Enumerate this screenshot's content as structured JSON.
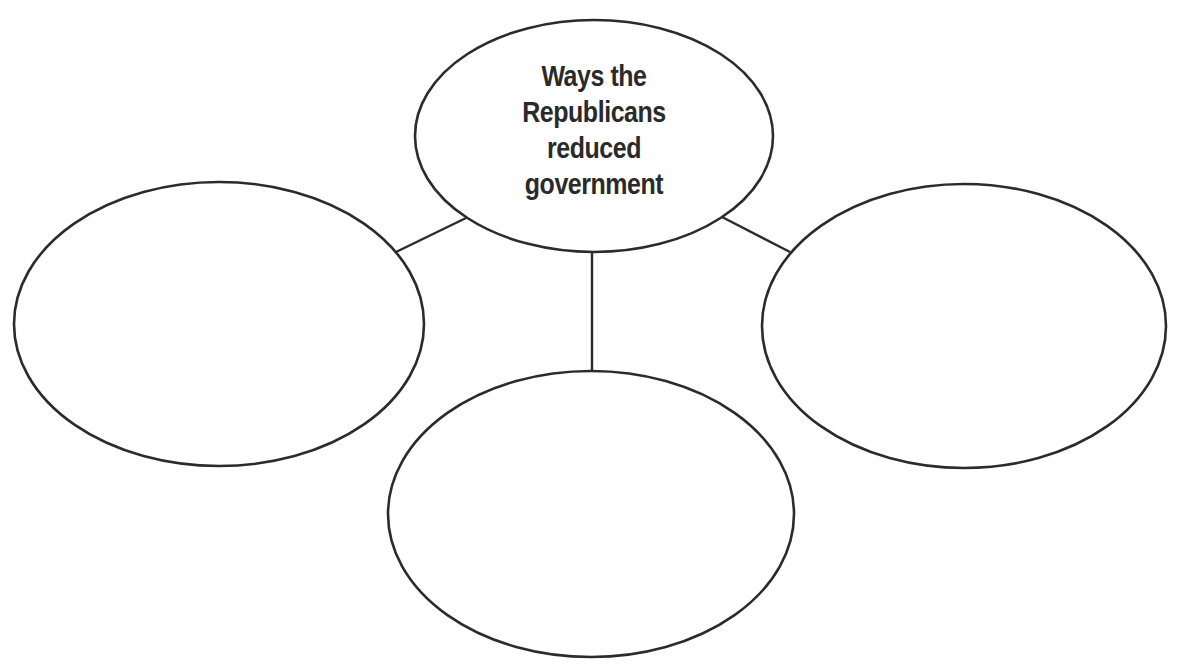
{
  "diagram": {
    "type": "concept-web",
    "center": {
      "label_lines": [
        "Ways the",
        "Republicans",
        "reduced",
        "government"
      ],
      "label": "Ways the Republicans reduced government"
    },
    "branches": [
      {
        "position": "left",
        "label": ""
      },
      {
        "position": "bottom",
        "label": ""
      },
      {
        "position": "right",
        "label": ""
      }
    ],
    "colors": {
      "stroke": "#2b2b2b",
      "background": "#ffffff",
      "text": "#2a2a2a"
    }
  }
}
